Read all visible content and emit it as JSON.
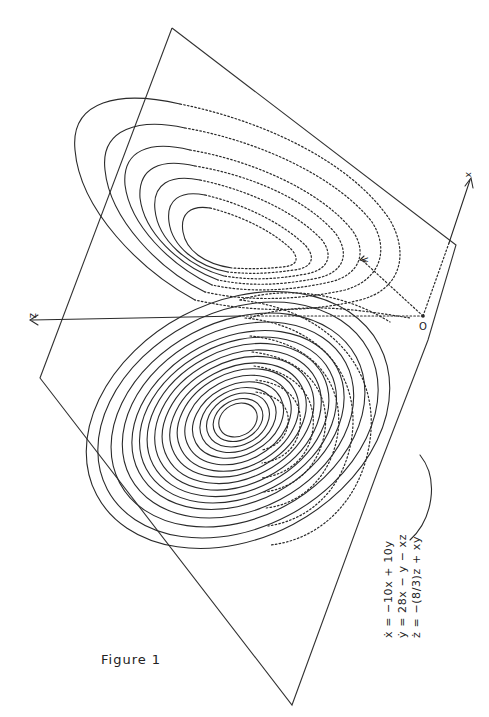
{
  "figure": {
    "caption": "Figure 1"
  },
  "axes": {
    "x_label": "x",
    "y_label": "y",
    "z_label": "z",
    "origin_label": "O"
  },
  "equations": {
    "line1": "ẋ = −10x + 10y",
    "line2": "ẏ = 28x − y − xz",
    "line3": "ż = −(8/3)z + xy"
  },
  "colors": {
    "ink": "#2a2a2a",
    "paper": "#ffffff"
  }
}
